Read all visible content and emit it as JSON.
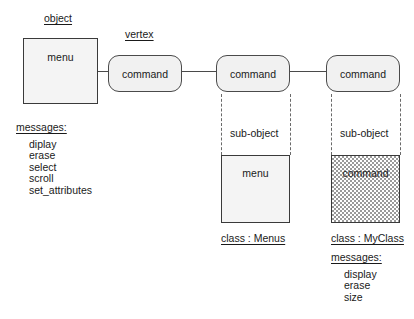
{
  "diagram": {
    "labels": {
      "object": "object",
      "vertex": "vertex",
      "sub_object_left": "sub-object",
      "sub_object_right": "sub-object"
    },
    "object_box": {
      "name": "menu"
    },
    "vertices": [
      {
        "name": "command"
      },
      {
        "name": "command"
      },
      {
        "name": "command"
      }
    ],
    "sub_objects": [
      {
        "name": "menu",
        "class_label": "class : Menus",
        "shaded": false
      },
      {
        "name": "command",
        "class_label": "class : MyClass",
        "shaded": true
      }
    ],
    "messages_left": {
      "heading": "messages:",
      "items": [
        "diplay",
        "erase",
        "select",
        "scroll",
        "set_attributes"
      ]
    },
    "messages_right": {
      "heading": "messages:",
      "items": [
        "display",
        "erase",
        "size"
      ]
    },
    "colors": {
      "stroke": "#3a3a3a",
      "fill_light": "#f4f4f4",
      "fill_vertex": "#f1f1f1",
      "fill_shaded": "#e8e8e8",
      "text": "#1a1a1a",
      "background": "#ffffff"
    }
  }
}
